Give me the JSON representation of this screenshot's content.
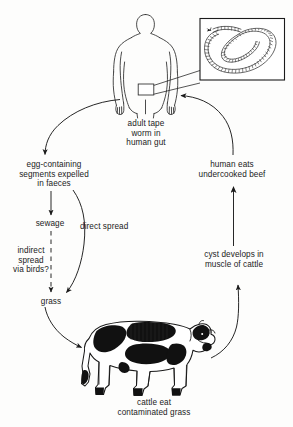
{
  "diagram": {
    "background_color": "#fdfdfc",
    "ink_color": "#1b1b1b",
    "labels": {
      "adult_tapeworm": "adult tape\nworm in\nhuman gut",
      "egg_segments": "egg-containing\nsegments expelled\nin faeces",
      "human_eats": "human eats\nundercooked beef",
      "sewage": "sewage",
      "indirect_spread": "indirect\nspread\nvia birds?",
      "direct_spread": "direct spread",
      "cyst_develops": "cyst develops in\nmuscle of cattle",
      "grass": "grass",
      "cattle_eat": "cattle eat\ncontaminated grass"
    },
    "illustrations": {
      "human_figure": "human-torso-outline",
      "tapeworm_inset": "coiled-segmented-tapeworm",
      "cow_figure": "holstein-cow-black-and-white"
    },
    "arrows": [
      {
        "name": "human-to-eggs",
        "style": "solid-curve",
        "from": "adult tape worm in human gut",
        "to": "egg-containing segments expelled in faeces"
      },
      {
        "name": "eggs-to-sewage",
        "style": "solid-straight",
        "from": "egg-containing segments expelled in faeces",
        "to": "sewage"
      },
      {
        "name": "sewage-to-grass-indirect",
        "style": "dashed-straight",
        "from": "sewage",
        "to": "grass"
      },
      {
        "name": "eggs-to-grass-direct",
        "style": "solid-curve",
        "from": "egg-containing segments expelled in faeces",
        "to": "grass"
      },
      {
        "name": "grass-to-cattle",
        "style": "solid-curve",
        "from": "grass",
        "to": "cattle eat contaminated grass"
      },
      {
        "name": "cattle-to-cyst",
        "style": "solid-curve",
        "from": "cattle eat contaminated grass",
        "to": "cyst develops in muscle of cattle"
      },
      {
        "name": "cyst-to-human-eats",
        "style": "solid-straight",
        "from": "cyst develops in muscle of cattle",
        "to": "human eats undercooked beef"
      },
      {
        "name": "human-eats-to-human",
        "style": "solid-curve",
        "from": "human eats undercooked beef",
        "to": "adult tape worm in human gut"
      },
      {
        "name": "gut-to-inset",
        "style": "leader-lines",
        "from": "human gut rectangle",
        "to": "tapeworm inset box"
      }
    ]
  }
}
